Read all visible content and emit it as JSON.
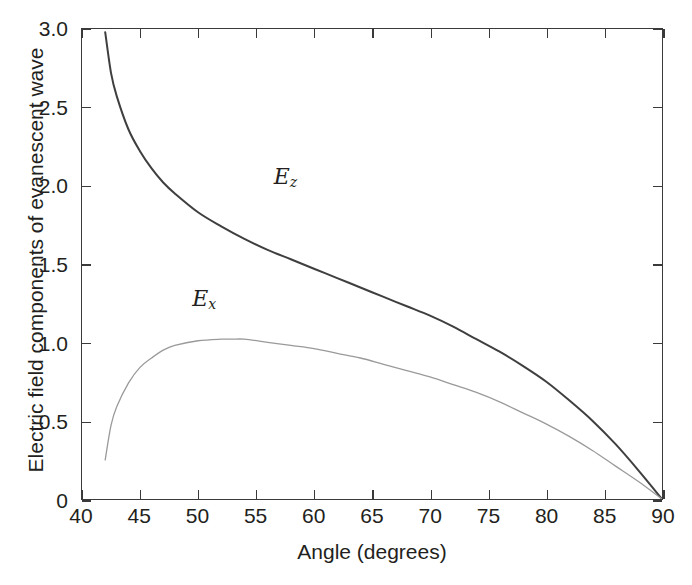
{
  "chart_data": {
    "type": "line",
    "title": "",
    "xlabel": "Angle (degrees)",
    "ylabel": "Electric field components of evanescent wave",
    "xlim": [
      40,
      90
    ],
    "ylim": [
      0,
      3.0
    ],
    "xticks": [
      40,
      45,
      50,
      55,
      60,
      65,
      70,
      75,
      80,
      85,
      90
    ],
    "xticklabels": [
      "40",
      "45",
      "50",
      "55",
      "60",
      "65",
      "70",
      "75",
      "80",
      "85",
      "90"
    ],
    "yticks": [
      0,
      0.5,
      1.0,
      1.5,
      2.0,
      2.5,
      3.0
    ],
    "yticklabels": [
      "0",
      "0.5",
      "1.0",
      "1.5",
      "2.0",
      "2.5",
      "3.0"
    ],
    "grid": false,
    "legend_position": "inline-annotations",
    "critical_angle": 41.8,
    "series": [
      {
        "name": "Ez",
        "label": "E",
        "label_sub": "z",
        "color": "#3f3f3f",
        "linewidth": 2.0,
        "annotation_x": 57.5,
        "annotation_y": 2.05,
        "x": [
          42.0,
          42.5,
          43.0,
          44.0,
          45.0,
          46.0,
          47.0,
          48.0,
          50.0,
          52.0,
          54.0,
          56.0,
          58.0,
          60.0,
          62.0,
          64.0,
          66.0,
          68.0,
          70.0,
          72.0,
          74.0,
          76.0,
          78.0,
          80.0,
          82.0,
          84.0,
          86.0,
          88.0,
          90.0
        ],
        "y": [
          2.98,
          2.72,
          2.57,
          2.36,
          2.22,
          2.11,
          2.02,
          1.95,
          1.83,
          1.74,
          1.66,
          1.59,
          1.53,
          1.47,
          1.41,
          1.35,
          1.29,
          1.23,
          1.17,
          1.1,
          1.02,
          0.94,
          0.85,
          0.75,
          0.63,
          0.5,
          0.35,
          0.18,
          0.0
        ]
      },
      {
        "name": "Ex",
        "label": "E",
        "label_sub": "x",
        "color": "#9a9a9a",
        "linewidth": 1.3,
        "annotation_x": 50.5,
        "annotation_y": 1.28,
        "x": [
          42.0,
          42.5,
          43.0,
          44.0,
          45.0,
          46.0,
          47.0,
          48.0,
          50.0,
          52.0,
          53.0,
          54.0,
          56.0,
          58.0,
          60.0,
          62.0,
          64.0,
          66.0,
          68.0,
          70.0,
          72.0,
          74.0,
          76.0,
          78.0,
          80.0,
          82.0,
          84.0,
          86.0,
          88.0,
          90.0
        ],
        "y": [
          0.25,
          0.47,
          0.59,
          0.74,
          0.84,
          0.9,
          0.95,
          0.98,
          1.01,
          1.02,
          1.02,
          1.02,
          1.0,
          0.98,
          0.96,
          0.93,
          0.9,
          0.86,
          0.82,
          0.78,
          0.73,
          0.68,
          0.62,
          0.55,
          0.48,
          0.4,
          0.31,
          0.21,
          0.11,
          0.0
        ]
      }
    ]
  },
  "figure": {
    "background_color": "#ffffff",
    "frame_color": "#3a3a3a",
    "text_color": "#231f20"
  }
}
